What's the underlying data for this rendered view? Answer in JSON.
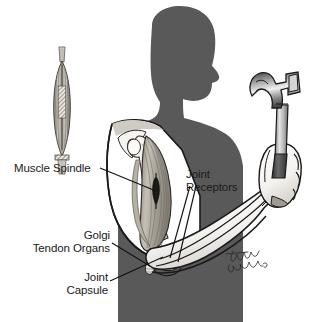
{
  "figure": {
    "background_color": "#ffffff",
    "silhouette_color": "#595959",
    "ink_color": "#1a1a1a",
    "muscle_color": "#b9b2a8",
    "bone_color": "#f2f0ec"
  },
  "labels": [
    {
      "id": "muscle-spindle",
      "text": "Muscle Spindle",
      "lines": [
        "Muscle Spindle"
      ],
      "align": "left",
      "x": 14,
      "y": 163
    },
    {
      "id": "joint-receptors",
      "text": "Joint Receptors",
      "lines": [
        "Joint",
        "Receptors"
      ],
      "align": "left",
      "x": 186,
      "y": 170
    },
    {
      "id": "golgi-tendon-organs",
      "text": "Golgi Tendon Organs",
      "lines": [
        "Golgi",
        "Tendon Organs"
      ],
      "align": "right",
      "x": 38,
      "y": 231
    },
    {
      "id": "joint-capsule",
      "text": "Joint Capsule",
      "lines": [
        "Joint",
        "Capsule"
      ],
      "align": "right",
      "x": 62,
      "y": 273
    }
  ],
  "label_text": {
    "muscle_spindle_l1": "Muscle Spindle",
    "joint_receptors_l1": "Joint",
    "joint_receptors_l2": "Receptors",
    "golgi_l1": "Golgi",
    "golgi_l2": "Tendon Organs",
    "joint_capsule_l1": "Joint",
    "joint_capsule_l2": "Capsule"
  },
  "signature": {
    "artist_mark": "Timothy Bowman",
    "rendered_as": "handwritten-script"
  },
  "caption": {
    "partial_text": ""
  },
  "diagram_elements": [
    {
      "name": "muscle-spindle-inset",
      "description": "fusiform muscle spindle with intrafusal fibers and annulospiral ending"
    },
    {
      "name": "head-torso-silhouette",
      "description": "dark gray profile silhouette of head, neck and torso facing right"
    },
    {
      "name": "shoulder-joint",
      "description": "humeral head and glenoid at shoulder"
    },
    {
      "name": "biceps-brachii",
      "description": "striated biceps muscle of the upper arm"
    },
    {
      "name": "humerus",
      "description": "upper arm bone"
    },
    {
      "name": "elbow-joint",
      "description": "elbow joint with capsule and tendon insertion"
    },
    {
      "name": "forearm",
      "description": "forearm with radius and ulna"
    },
    {
      "name": "fist",
      "description": "closed hand gripping hammer handle"
    },
    {
      "name": "claw-hammer",
      "description": "claw hammer with metal head and dark rubber grip"
    }
  ]
}
